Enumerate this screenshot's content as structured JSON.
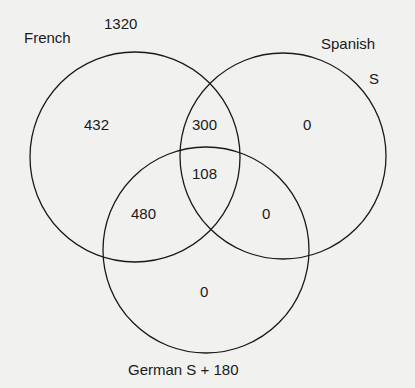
{
  "diagram": {
    "type": "venn",
    "sets": [
      {
        "name": "French",
        "total": "1320"
      },
      {
        "name": "Spanish",
        "total": "S"
      },
      {
        "name": "German",
        "total": "S + 180"
      }
    ],
    "labels": {
      "french": "French",
      "french_total": "1320",
      "spanish": "Spanish",
      "spanish_total": "S",
      "german": "German S + 180"
    },
    "regions": {
      "french_only": "432",
      "spanish_only": "0",
      "german_only": "0",
      "french_spanish": "300",
      "french_german": "480",
      "spanish_german": "0",
      "all_three": "108"
    },
    "colors": {
      "stroke": "#1a1a1a",
      "background": "#f1f1f0"
    }
  }
}
